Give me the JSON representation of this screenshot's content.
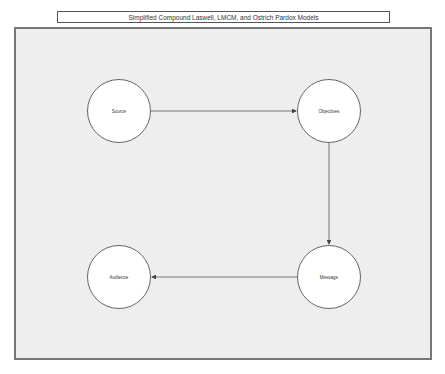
{
  "title": "Simplified Compound Laswell, LMCM, and Ostrich Pardox Models",
  "nodes": [
    {
      "id": "source",
      "label": "Source",
      "cx": 119,
      "cy": 111
    },
    {
      "id": "objectives",
      "label": "Objectives",
      "cx": 329,
      "cy": 111
    },
    {
      "id": "message",
      "label": "Message",
      "cx": 329,
      "cy": 277
    },
    {
      "id": "audience",
      "label": "Audience",
      "cx": 119,
      "cy": 277
    }
  ],
  "edges": [
    {
      "from": "source",
      "to": "objectives"
    },
    {
      "from": "objectives",
      "to": "message"
    },
    {
      "from": "message",
      "to": "audience"
    }
  ]
}
